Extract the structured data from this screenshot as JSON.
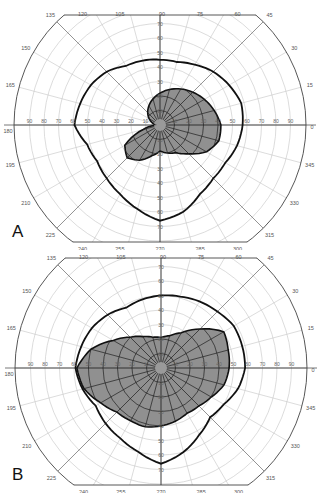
{
  "chart_data": [
    {
      "type": "polar",
      "panel_label": "A",
      "title": "",
      "meridian_labels": [
        0,
        15,
        30,
        45,
        60,
        75,
        90,
        105,
        120,
        135,
        150,
        165,
        180,
        195,
        210,
        225,
        240,
        255,
        270,
        285,
        300,
        315,
        330,
        345
      ],
      "radial_ticks": [
        10,
        20,
        30,
        40,
        50,
        60,
        70
      ],
      "horizontal_ticks": [
        10,
        20,
        30,
        40,
        50,
        60,
        70,
        80,
        90
      ],
      "radial_range": [
        0,
        90
      ],
      "series": [
        {
          "name": "outer isopter",
          "style": "outline",
          "meridians": [
            0,
            15,
            30,
            45,
            60,
            75,
            90,
            105,
            120,
            135,
            150,
            165,
            180,
            195,
            210,
            225,
            240,
            255,
            270,
            285,
            300,
            315,
            330,
            345
          ],
          "values": [
            57,
            58,
            55,
            52,
            48,
            45,
            45,
            46,
            47,
            52,
            55,
            57,
            59,
            52,
            50,
            52,
            55,
            60,
            66,
            62,
            55,
            52,
            52,
            55
          ]
        },
        {
          "name": "inner isopter (shaded)",
          "style": "filled",
          "meridians": [
            0,
            180,
            195,
            210,
            225,
            240,
            255,
            270,
            285,
            300,
            315,
            330,
            345
          ],
          "values": [
            42,
            2,
            12,
            28,
            32,
            28,
            22,
            18,
            20,
            22,
            28,
            37,
            42
          ]
        }
      ]
    },
    {
      "type": "polar",
      "panel_label": "B",
      "title": "",
      "meridian_labels": [
        0,
        15,
        30,
        45,
        60,
        75,
        90,
        105,
        120,
        135,
        150,
        165,
        180,
        195,
        210,
        225,
        240,
        255,
        270,
        285,
        300,
        315,
        330,
        345
      ],
      "radial_ticks": [
        10,
        20,
        30,
        40,
        50,
        60,
        70
      ],
      "horizontal_ticks": [
        10,
        20,
        30,
        40,
        50,
        60,
        70,
        80,
        90
      ],
      "radial_range": [
        0,
        90
      ],
      "series": [
        {
          "name": "outer isopter",
          "style": "outline",
          "meridians": [
            0,
            15,
            30,
            45,
            60,
            75,
            90,
            105,
            120,
            135,
            150,
            165,
            180,
            195,
            210,
            225,
            240,
            255,
            270,
            285,
            300,
            315,
            330,
            345
          ],
          "values": [
            58,
            58,
            58,
            55,
            53,
            51,
            50,
            49,
            48,
            52,
            55,
            57,
            59,
            56,
            52,
            54,
            56,
            60,
            66,
            60,
            53,
            48,
            50,
            55
          ]
        },
        {
          "name": "inner isopter (shaded)",
          "style": "filled",
          "meridians": [
            0,
            15,
            30,
            45,
            60,
            75,
            90,
            105,
            120,
            135,
            150,
            165,
            180,
            195,
            210,
            225,
            240,
            255,
            270,
            285,
            300,
            315,
            330,
            345
          ],
          "values": [
            47,
            48,
            50,
            38,
            28,
            23,
            21,
            22,
            25,
            30,
            38,
            50,
            58,
            55,
            48,
            43,
            42,
            42,
            40,
            38,
            36,
            37,
            40,
            45
          ]
        }
      ]
    }
  ],
  "panels": {
    "a": {
      "label": "A"
    },
    "b": {
      "label": "B"
    }
  },
  "caption": ""
}
